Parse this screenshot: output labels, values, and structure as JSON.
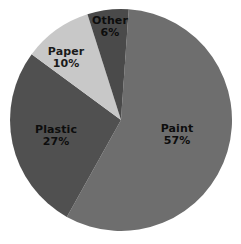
{
  "chart_data": {
    "type": "pie",
    "title": "",
    "subtitle": "",
    "xlabel": "",
    "ylabel": "",
    "legend_position": "none",
    "grid": false,
    "labels_inside": true,
    "value_suffix": "%",
    "categories": [
      "Paint",
      "Plastic",
      "Paper",
      "Other"
    ],
    "values": [
      57,
      27,
      10,
      6
    ],
    "slices": [
      {
        "name": "Paint",
        "value": 57,
        "value_text": "57%",
        "color": "#6e6e6e",
        "start_angle": 4,
        "end_angle": 209.2,
        "label_x": 177,
        "label_y": 135
      },
      {
        "name": "Plastic",
        "value": 27,
        "value_text": "27%",
        "color": "#505050",
        "start_angle": 209.2,
        "end_angle": 306.4,
        "label_x": 56,
        "label_y": 136
      },
      {
        "name": "Paper",
        "value": 10,
        "value_text": "10%",
        "color": "#c8c8c8",
        "start_angle": 306.4,
        "end_angle": 342.4,
        "label_x": 66,
        "label_y": 58
      },
      {
        "name": "Other",
        "value": 6,
        "value_text": "6%",
        "color": "#4a4a4a",
        "start_angle": 342.4,
        "end_angle": 364,
        "label_x": 110,
        "label_y": 27
      }
    ],
    "geometry": {
      "center_x": 121,
      "center_y": 120,
      "radius": 111
    },
    "background_color": "#ffffff"
  }
}
